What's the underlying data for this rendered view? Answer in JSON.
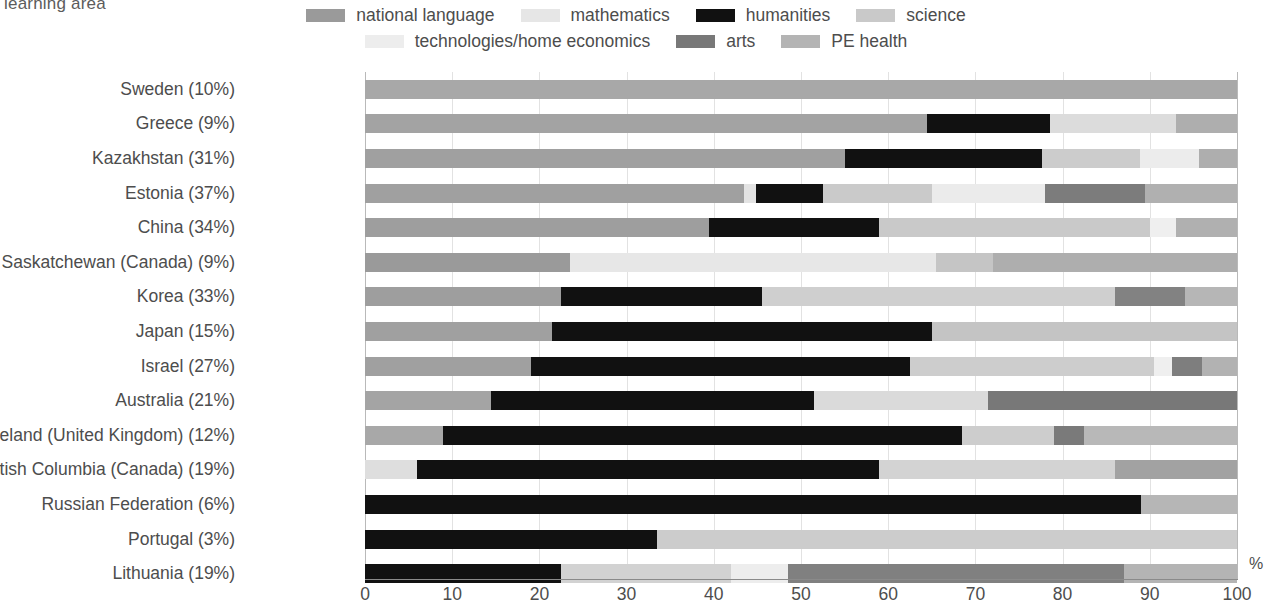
{
  "caption": "learning area",
  "axis_unit": "%",
  "legend": {
    "row1": [
      {
        "label": "national language",
        "color": "#9a9a9a"
      },
      {
        "label": "mathematics",
        "color": "#e6e6e6"
      },
      {
        "label": "humanities",
        "color": "#111111"
      },
      {
        "label": "science",
        "color": "#c9c9c9"
      }
    ],
    "row2": [
      {
        "label": "technologies/home economics",
        "color": "#ededed"
      },
      {
        "label": "arts",
        "color": "#787878"
      },
      {
        "label": "PE health",
        "color": "#b4b4b4"
      }
    ]
  },
  "chart_data": {
    "type": "bar",
    "orientation": "horizontal",
    "stacked": true,
    "normalized": true,
    "title": "learning area",
    "xlabel": "%",
    "ylabel": "",
    "xlim": [
      0,
      100
    ],
    "xticks": [
      0,
      10,
      20,
      30,
      40,
      50,
      60,
      70,
      80,
      90,
      100
    ],
    "grid": true,
    "legend_position": "top-center",
    "series": [
      {
        "name": "national language",
        "color": "#9a9a9a"
      },
      {
        "name": "mathematics",
        "color": "#e6e6e6"
      },
      {
        "name": "humanities",
        "color": "#111111"
      },
      {
        "name": "science",
        "color": "#c9c9c9"
      },
      {
        "name": "technologies/home economics",
        "color": "#ededed"
      },
      {
        "name": "arts",
        "color": "#787878"
      },
      {
        "name": "PE health",
        "color": "#b4b4b4"
      }
    ],
    "categories": [
      "Sweden (10%)",
      "Greece (9%)",
      "Kazakhstan (31%)",
      "Estonia (37%)",
      "China (34%)",
      "Saskatchewan (Canada) (9%)",
      "Korea (33%)",
      "Japan (15%)",
      "Israel (27%)",
      "Australia (21%)",
      "Northern Ireland (United Kingdom) (12%)",
      "British Columbia (Canada) (19%)",
      "Russian Federation (6%)",
      "Portugal (3%)",
      "Lithuania (19%)"
    ],
    "rows": [
      {
        "category": "Sweden (10%)",
        "segments": [
          {
            "series": "PE health",
            "value": 100,
            "color": "#a8a8a8"
          }
        ]
      },
      {
        "category": "Greece (9%)",
        "segments": [
          {
            "series": "national language",
            "value": 64.5,
            "color": "#a3a3a3"
          },
          {
            "series": "humanities",
            "value": 14.1,
            "color": "#111111"
          },
          {
            "series": "science",
            "value": 14.4,
            "color": "#dcdcdc"
          },
          {
            "series": "PE health",
            "value": 7.0,
            "color": "#aeaeae"
          }
        ]
      },
      {
        "category": "Kazakhstan (31%)",
        "segments": [
          {
            "series": "national language",
            "value": 55.0,
            "color": "#a0a0a0"
          },
          {
            "series": "humanities",
            "value": 22.6,
            "color": "#111111"
          },
          {
            "series": "science",
            "value": 11.3,
            "color": "#cccccc"
          },
          {
            "series": "technologies/home economics",
            "value": 6.7,
            "color": "#ececec"
          },
          {
            "series": "PE health",
            "value": 4.4,
            "color": "#aeaeae"
          }
        ]
      },
      {
        "category": "Estonia (37%)",
        "segments": [
          {
            "series": "national language",
            "value": 43.5,
            "color": "#a0a0a0"
          },
          {
            "series": "mathematics",
            "value": 1.3,
            "color": "#e3e3e3"
          },
          {
            "series": "humanities",
            "value": 7.7,
            "color": "#111111"
          },
          {
            "series": "science",
            "value": 12.5,
            "color": "#cacaca"
          },
          {
            "series": "technologies/home economics",
            "value": 13.0,
            "color": "#ebebeb"
          },
          {
            "series": "arts",
            "value": 11.5,
            "color": "#7c7c7c"
          },
          {
            "series": "PE health",
            "value": 10.5,
            "color": "#b0b0b0"
          }
        ]
      },
      {
        "category": "China (34%)",
        "segments": [
          {
            "series": "national language",
            "value": 39.5,
            "color": "#9e9e9e"
          },
          {
            "series": "humanities",
            "value": 19.5,
            "color": "#111111"
          },
          {
            "series": "science",
            "value": 31.0,
            "color": "#c9c9c9"
          },
          {
            "series": "technologies/home economics",
            "value": 3.0,
            "color": "#efefef"
          },
          {
            "series": "PE health",
            "value": 7.0,
            "color": "#b0b0b0"
          }
        ]
      },
      {
        "category": "Saskatchewan (Canada) (9%)",
        "segments": [
          {
            "series": "national language",
            "value": 23.5,
            "color": "#9a9a9a"
          },
          {
            "series": "mathematics",
            "value": 42.0,
            "color": "#e7e7e7"
          },
          {
            "series": "science",
            "value": 6.5,
            "color": "#c5c5c5"
          },
          {
            "series": "PE health",
            "value": 28.0,
            "color": "#aeaeae"
          }
        ]
      },
      {
        "category": "Korea (33%)",
        "segments": [
          {
            "series": "national language",
            "value": 22.5,
            "color": "#9e9e9e"
          },
          {
            "series": "humanities",
            "value": 23.0,
            "color": "#111111"
          },
          {
            "series": "science",
            "value": 40.5,
            "color": "#cfcfcf"
          },
          {
            "series": "arts",
            "value": 8.0,
            "color": "#828282"
          },
          {
            "series": "PE health",
            "value": 6.0,
            "color": "#b6b6b6"
          }
        ]
      },
      {
        "category": "Japan (15%)",
        "segments": [
          {
            "series": "national language",
            "value": 21.5,
            "color": "#a0a0a0"
          },
          {
            "series": "humanities",
            "value": 43.5,
            "color": "#111111"
          },
          {
            "series": "science",
            "value": 35.0,
            "color": "#c4c4c4"
          }
        ]
      },
      {
        "category": "Israel (27%)",
        "segments": [
          {
            "series": "national language",
            "value": 19.0,
            "color": "#a0a0a0"
          },
          {
            "series": "humanities",
            "value": 43.5,
            "color": "#111111"
          },
          {
            "series": "science",
            "value": 28.0,
            "color": "#cdcdcd"
          },
          {
            "series": "technologies/home economics",
            "value": 2.0,
            "color": "#efefef"
          },
          {
            "series": "arts",
            "value": 3.5,
            "color": "#7e7e7e"
          },
          {
            "series": "PE health",
            "value": 4.0,
            "color": "#b2b2b2"
          }
        ]
      },
      {
        "category": "Australia (21%)",
        "segments": [
          {
            "series": "national language",
            "value": 14.5,
            "color": "#a4a4a4"
          },
          {
            "series": "humanities",
            "value": 37.0,
            "color": "#111111"
          },
          {
            "series": "science",
            "value": 20.0,
            "color": "#dadada"
          },
          {
            "series": "arts",
            "value": 28.5,
            "color": "#787878"
          }
        ]
      },
      {
        "category": "Northern Ireland (United Kingdom) (12%)",
        "segments": [
          {
            "series": "national language",
            "value": 9.0,
            "color": "#a8a8a8"
          },
          {
            "series": "humanities",
            "value": 59.5,
            "color": "#111111"
          },
          {
            "series": "science",
            "value": 10.5,
            "color": "#cdcdcd"
          },
          {
            "series": "arts",
            "value": 3.5,
            "color": "#7a7a7a"
          },
          {
            "series": "PE health",
            "value": 17.5,
            "color": "#b8b8b8"
          }
        ]
      },
      {
        "category": "British Columbia (Canada) (19%)",
        "segments": [
          {
            "series": "mathematics",
            "value": 6.0,
            "color": "#dedede"
          },
          {
            "series": "humanities",
            "value": 53.0,
            "color": "#111111"
          },
          {
            "series": "science",
            "value": 27.0,
            "color": "#d3d3d3"
          },
          {
            "series": "arts",
            "value": 14.0,
            "color": "#a2a2a2"
          }
        ]
      },
      {
        "category": "Russian Federation (6%)",
        "segments": [
          {
            "series": "humanities",
            "value": 89.0,
            "color": "#111111"
          },
          {
            "series": "PE health",
            "value": 11.0,
            "color": "#b6b6b6"
          }
        ]
      },
      {
        "category": "Portugal (3%)",
        "segments": [
          {
            "series": "humanities",
            "value": 33.5,
            "color": "#111111"
          },
          {
            "series": "science",
            "value": 66.5,
            "color": "#cccccc"
          }
        ]
      },
      {
        "category": "Lithuania (19%)",
        "segments": [
          {
            "series": "humanities",
            "value": 22.5,
            "color": "#111111"
          },
          {
            "series": "science",
            "value": 19.5,
            "color": "#d2d2d2"
          },
          {
            "series": "technologies/home economics",
            "value": 6.5,
            "color": "#ededed"
          },
          {
            "series": "arts",
            "value": 38.5,
            "color": "#808080"
          },
          {
            "series": "PE health",
            "value": 13.0,
            "color": "#b4b4b4"
          }
        ]
      }
    ]
  }
}
